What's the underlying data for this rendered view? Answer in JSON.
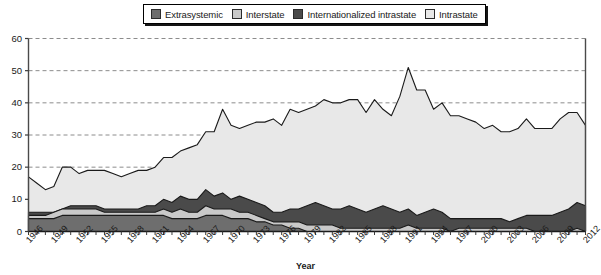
{
  "chart_data": {
    "type": "area",
    "stacked": true,
    "title": "",
    "xlabel": "Year",
    "ylabel": "",
    "ylim": [
      0,
      60
    ],
    "yticks": [
      0,
      10,
      20,
      30,
      40,
      50,
      60
    ],
    "grid": "horizontal-dashed",
    "legend_position": "top-center",
    "x": [
      1946,
      1947,
      1948,
      1949,
      1950,
      1951,
      1952,
      1953,
      1954,
      1955,
      1956,
      1957,
      1958,
      1959,
      1960,
      1961,
      1962,
      1963,
      1964,
      1965,
      1966,
      1967,
      1968,
      1969,
      1970,
      1971,
      1972,
      1973,
      1974,
      1975,
      1976,
      1977,
      1978,
      1979,
      1980,
      1981,
      1982,
      1983,
      1984,
      1985,
      1986,
      1987,
      1988,
      1989,
      1990,
      1991,
      1992,
      1993,
      1994,
      1995,
      1996,
      1997,
      1998,
      1999,
      2000,
      2001,
      2002,
      2003,
      2004,
      2005,
      2006,
      2007,
      2008,
      2009,
      2010,
      2011,
      2012
    ],
    "xtick_labels": [
      1946,
      1949,
      1952,
      1955,
      1958,
      1961,
      1964,
      1967,
      1970,
      1973,
      1976,
      1979,
      1982,
      1985,
      1988,
      1991,
      1994,
      1997,
      2000,
      2003,
      2006,
      2009,
      2012
    ],
    "series": [
      {
        "name": "Extrasystemic",
        "color": "#6e6e6e",
        "values": [
          4,
          4,
          4,
          4,
          5,
          5,
          5,
          5,
          5,
          5,
          5,
          5,
          5,
          5,
          5,
          5,
          5,
          4,
          4,
          4,
          4,
          5,
          5,
          5,
          4,
          4,
          4,
          3,
          3,
          2,
          2,
          1,
          1,
          0,
          0,
          0,
          0,
          0,
          0,
          0,
          0,
          0,
          0,
          0,
          0,
          0,
          0,
          0,
          0,
          0,
          0,
          0,
          0,
          0,
          0,
          0,
          0,
          0,
          0,
          0,
          0,
          0,
          0,
          0,
          0,
          0,
          0
        ]
      },
      {
        "name": "Interstate",
        "color": "#c9c9c9",
        "values": [
          1,
          1,
          1,
          2,
          2,
          2,
          2,
          2,
          2,
          1,
          1,
          1,
          1,
          1,
          1,
          1,
          2,
          2,
          3,
          2,
          2,
          3,
          2,
          2,
          3,
          2,
          2,
          2,
          1,
          1,
          1,
          2,
          2,
          2,
          2,
          2,
          2,
          1,
          1,
          1,
          1,
          1,
          1,
          1,
          1,
          2,
          1,
          1,
          1,
          1,
          0,
          1,
          1,
          1,
          1,
          1,
          1,
          1,
          1,
          1,
          0,
          0,
          0,
          0,
          0,
          1,
          0
        ]
      },
      {
        "name": "Internationalized intrastate",
        "color": "#4a4a4a",
        "values": [
          1,
          1,
          1,
          0,
          0,
          1,
          1,
          1,
          1,
          1,
          1,
          1,
          1,
          1,
          2,
          2,
          3,
          3,
          4,
          4,
          4,
          5,
          4,
          5,
          3,
          5,
          4,
          4,
          4,
          3,
          3,
          4,
          4,
          6,
          7,
          6,
          5,
          6,
          7,
          6,
          5,
          6,
          7,
          6,
          5,
          5,
          4,
          5,
          6,
          5,
          4,
          3,
          3,
          3,
          3,
          3,
          3,
          2,
          3,
          4,
          5,
          5,
          5,
          6,
          7,
          8,
          8
        ]
      },
      {
        "name": "Intrastate",
        "color": "#e8e8e8",
        "values": [
          11,
          9,
          7,
          8,
          13,
          12,
          10,
          11,
          11,
          12,
          11,
          10,
          11,
          12,
          11,
          12,
          13,
          14,
          14,
          16,
          17,
          18,
          20,
          26,
          23,
          21,
          23,
          25,
          26,
          29,
          27,
          31,
          30,
          30,
          30,
          33,
          33,
          33,
          33,
          34,
          31,
          34,
          30,
          29,
          36,
          44,
          39,
          38,
          31,
          34,
          32,
          32,
          31,
          30,
          28,
          29,
          27,
          28,
          28,
          30,
          27,
          27,
          27,
          29,
          30,
          28,
          25
        ]
      }
    ],
    "totals_note": "stacked order bottom to top: Extrasystemic, Interstate, Internationalized intrastate, Intrastate"
  },
  "legend": {
    "items": [
      {
        "label": "Extrasystemic",
        "color": "#6e6e6e"
      },
      {
        "label": "Interstate",
        "color": "#c9c9c9"
      },
      {
        "label": "Internationalized intrastate",
        "color": "#4a4a4a"
      },
      {
        "label": "Intrastate",
        "color": "#e8e8e8"
      }
    ]
  },
  "axes": {
    "x_title": "Year"
  }
}
